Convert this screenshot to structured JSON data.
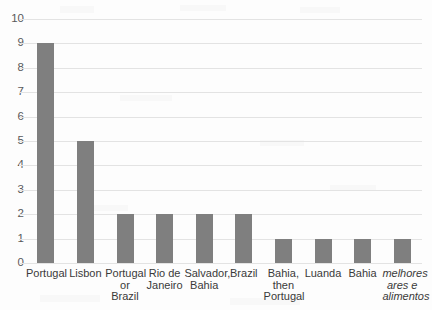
{
  "chart_data": {
    "type": "bar",
    "title": "",
    "subtitle": "",
    "xlabel": "",
    "ylabel": "",
    "categories": [
      "Portugal",
      "Lisbon",
      "Portugal or Brazil",
      "Rio de Janeiro",
      "Salvador, Bahia",
      "Brazil",
      "Bahia, then Portugal",
      "Luanda",
      "Bahia",
      "melhores ares e alimentos"
    ],
    "category_label_lines": [
      [
        "Portugal"
      ],
      [
        "Lisbon"
      ],
      [
        "Portugal",
        "or Brazil"
      ],
      [
        "Rio de",
        "Janeiro"
      ],
      [
        "Salvador,",
        "Bahia"
      ],
      [
        "Brazil"
      ],
      [
        "Bahia,",
        "then",
        "Portugal"
      ],
      [
        "Luanda"
      ],
      [
        "Bahia"
      ],
      [
        "melhores",
        "ares e",
        "alimentos"
      ]
    ],
    "category_label_styles": [
      "normal",
      "normal",
      "normal",
      "normal",
      "normal",
      "normal",
      "normal",
      "normal",
      "normal",
      "italic"
    ],
    "values": [
      9,
      5,
      2,
      2,
      2,
      2,
      1,
      1,
      1,
      1
    ],
    "ylim": [
      0,
      10
    ],
    "ytick_labels": [
      "10",
      "9",
      "8",
      "7",
      "6",
      "5",
      "4",
      "3",
      "2",
      "1",
      "0"
    ],
    "ytick_values": [
      10,
      9,
      8,
      7,
      6,
      5,
      4,
      3,
      2,
      1,
      0
    ],
    "grid": true,
    "grid_axis": "y",
    "legend": false,
    "legend_position": "none",
    "bar_color": "#7f7f7f",
    "grid_color": "#e3e3e3",
    "tick_label_color": "#58595b",
    "category_label_color": "#3a3a3a",
    "background_color": "#fdfdfd"
  }
}
